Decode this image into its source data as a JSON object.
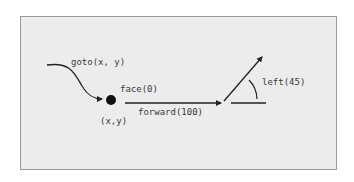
{
  "diagram": {
    "labels": {
      "goto": "goto(x, y)",
      "face": "face(0)",
      "forward": "forward(100)",
      "position": "(x,y)",
      "left": "left(45)"
    },
    "colors": {
      "background": "#ececec",
      "border": "#9a9a9a",
      "stroke": "#222222",
      "text": "#3a3a3a"
    }
  }
}
